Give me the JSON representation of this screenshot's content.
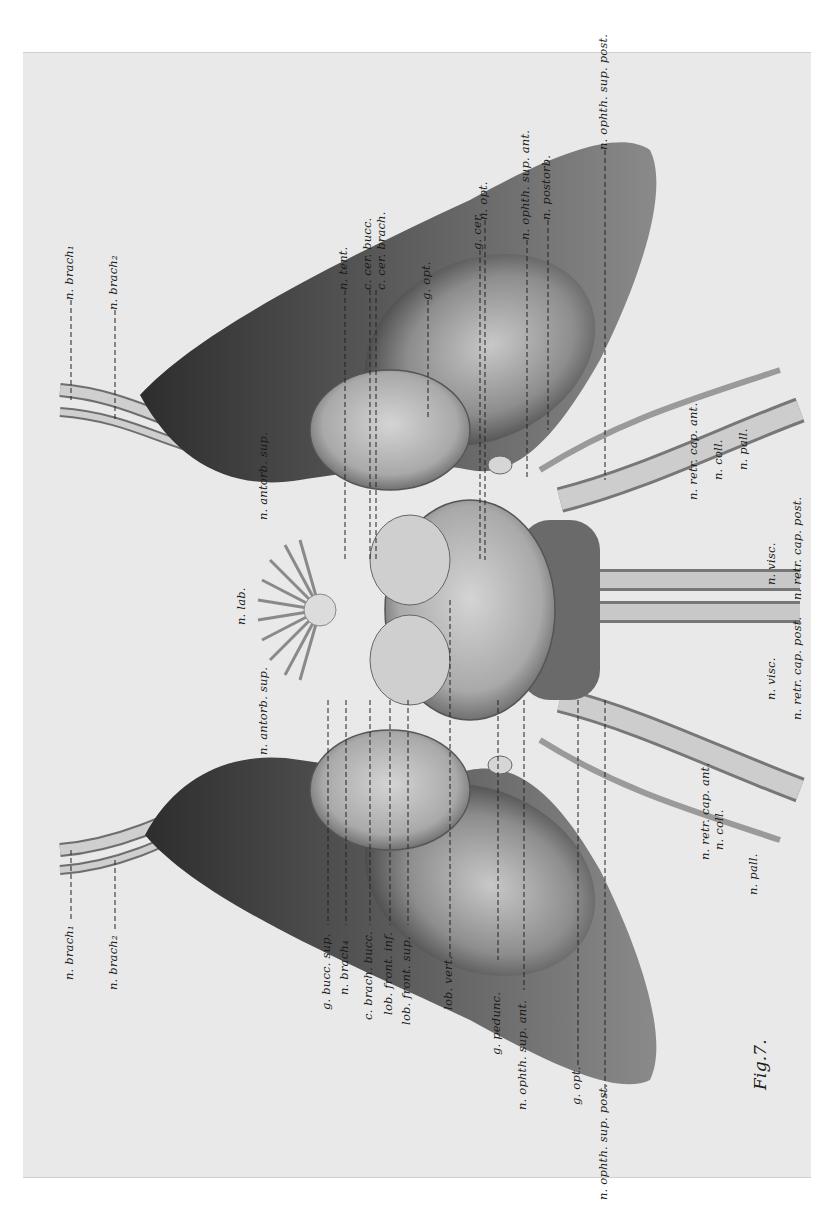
{
  "figure": {
    "caption": "Fig.7.",
    "background_color": "#e9e9e9",
    "ink_color": "#1a1a1a"
  },
  "labels": {
    "top_left": {
      "n_brach1": "n. brach₁",
      "n_brach2": "n. brach₂"
    },
    "top_row": {
      "n_tent": "n. tent.",
      "c_cer_bucc": "c. cer. bucc.",
      "c_cer_brach": "c. cer. brach.",
      "g_opt": "g. opt.",
      "g_cer": "g. cer.",
      "n_opt": "n. opt.",
      "n_ophth_sup_ant": "n. ophth. sup. ant.",
      "n_postorb": "n. postorb.",
      "n_ophth_sup_post": "n. ophth. sup. post."
    },
    "center": {
      "n_antorb_sup_upper": "n. antorb. sup.",
      "n_lab": "n. lab.",
      "n_antorb_sup_lower": "n. antorb. sup."
    },
    "right_upper": {
      "n_retr_cap_ant": "n. retr. cap. ant.",
      "n_coll": "n. coll.",
      "n_pall": "n. pall.",
      "n_retr_cap_post": "n. retr. cap. post.",
      "n_visc": "n. visc."
    },
    "right_lower": {
      "n_visc": "n. visc.",
      "n_retr_cap_post": "n. retr. cap. post.",
      "n_retr_cap_ant": "n. retr. cap. ant.",
      "n_coll": "n. coll.",
      "n_pall": "n. pall."
    },
    "bottom_left": {
      "n_brach1": "n. brach₁",
      "n_brach2": "n. brach₂"
    },
    "bottom_row": {
      "g_bucc_sup": "g. bucc. sup.",
      "n_brach4": "n. brach₄",
      "c_brach_bucc": "c. brach. bucc.",
      "lob_front_inf": "lob. front. inf.",
      "lob_front_sup": "lob. front. sup.",
      "lob_vert": "lob. vert.",
      "g_pedunc": "g. pedunc.",
      "n_ophth_sup_ant": "n. ophth. sup. ant.",
      "g_opt": "g. opt.",
      "n_ophth_sup_post": "n. ophth. sup. post."
    }
  }
}
